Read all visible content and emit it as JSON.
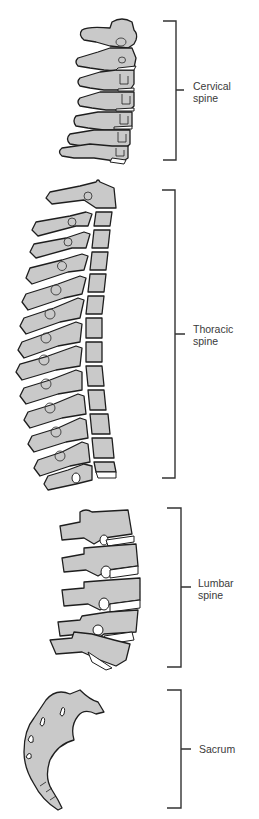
{
  "figure": {
    "colors": {
      "background": "#ffffff",
      "bone_fill": "#c9c9c9",
      "outline": "#1e1e1e",
      "bracket": "#333333",
      "label_text": "#3a3a3a"
    }
  },
  "regions": [
    {
      "id": "cervical",
      "line1": "Cervical",
      "line2": "spine",
      "vertebrae_count": 7
    },
    {
      "id": "thoracic",
      "line1": "Thoracic",
      "line2": "spine",
      "vertebrae_count": 12
    },
    {
      "id": "lumbar",
      "line1": "Lumbar",
      "line2": "spine",
      "vertebrae_count": 5
    },
    {
      "id": "sacrum",
      "line1": "Sacrum",
      "line2": "",
      "vertebrae_count": 0
    }
  ]
}
